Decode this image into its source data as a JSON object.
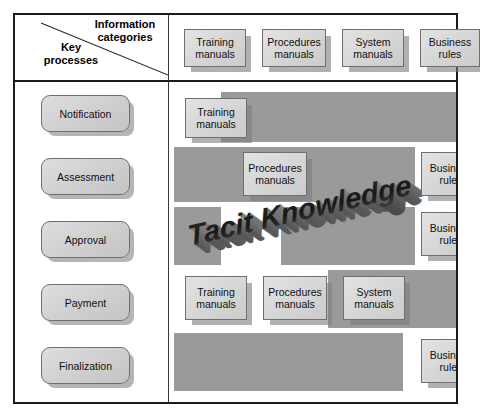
{
  "diagram": {
    "legend": {
      "row_axis_label": "Key\nprocesses",
      "column_axis_label": "Information\ncategories"
    },
    "colors": {
      "band_gray": "#9a9a9a",
      "box_fill": "#d6d6d6",
      "box_border": "#6f6f6f",
      "frame_border": "#1a1a1a",
      "shadow": "#7d7d7d",
      "background": "#ffffff",
      "text": "#111111"
    },
    "watermark": {
      "text": "Tacit Knowledge",
      "style": "3d-extruded-perspective"
    },
    "column_headers": [
      {
        "label": "Training\nmanuals"
      },
      {
        "label": "Procedures\nmanuals"
      },
      {
        "label": "System\nmanuals"
      },
      {
        "label": "Business\nrules"
      }
    ],
    "row_headers": [
      {
        "label": "Notification"
      },
      {
        "label": "Assessment"
      },
      {
        "label": "Approval"
      },
      {
        "label": "Payment"
      },
      {
        "label": "Finalization"
      }
    ],
    "cells": [
      {
        "row": "Notification",
        "column": "Training manuals",
        "label": "Training\nmanuals"
      },
      {
        "row": "Assessment",
        "column": "Procedures manuals",
        "label": "Procedures\nmanuals"
      },
      {
        "row": "Assessment",
        "column": "Business rules",
        "label": "Business\nrules"
      },
      {
        "row": "Approval",
        "column": "Business rules",
        "label": "Business\nrules"
      },
      {
        "row": "Payment",
        "column": "Training manuals",
        "label": "Training\nmanuals"
      },
      {
        "row": "Payment",
        "column": "Procedures manuals",
        "label": "Procedures\nmanuals"
      },
      {
        "row": "Payment",
        "column": "System manuals",
        "label": "System\nmanuals"
      },
      {
        "row": "Finalization",
        "column": "Business rules",
        "label": "Business\nrules"
      }
    ]
  }
}
